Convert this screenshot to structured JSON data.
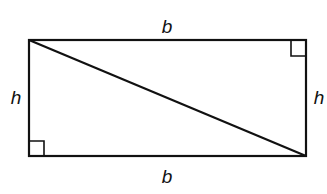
{
  "diagram": {
    "labels": {
      "top": "b",
      "bottom": "b",
      "left": "h",
      "right": "h"
    },
    "shapes": {
      "rectangle": {
        "x": 29,
        "y": 40,
        "width": 277,
        "height": 116
      },
      "diagonal": {
        "x1": 29,
        "y1": 40,
        "x2": 306,
        "y2": 156
      },
      "right_angle_markers": [
        "top-right",
        "bottom-left"
      ]
    },
    "colors": {
      "stroke": "#111111",
      "background": "#ffffff"
    }
  }
}
